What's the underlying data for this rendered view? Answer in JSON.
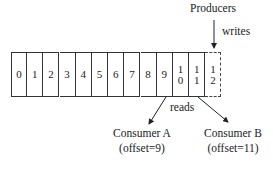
{
  "labels": {
    "producers": "Producers",
    "writes": "writes",
    "reads": "reads"
  },
  "log_cells": [
    "0",
    "1",
    "2",
    "3",
    "4",
    "5",
    "6",
    "7",
    "8",
    "9",
    "1\n0",
    "1\n1",
    "1\n2"
  ],
  "consumers": [
    {
      "name": "Consumer A",
      "offset": "(offset=9)"
    },
    {
      "name": "Consumer B",
      "offset": "(offset=11)"
    }
  ]
}
